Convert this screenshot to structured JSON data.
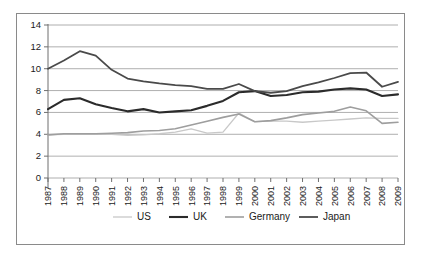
{
  "chart_data": {
    "type": "line",
    "title": "",
    "subtitle": "",
    "xlabel": "",
    "ylabel": "",
    "ylim": [
      0,
      14
    ],
    "yticks": [
      0,
      2,
      4,
      6,
      8,
      10,
      12,
      14
    ],
    "ytick_labels": [
      "0",
      "2",
      "4",
      "6",
      "8",
      "10",
      "12",
      "14"
    ],
    "grid": true,
    "grid_axis": "y",
    "legend_position": "bottom",
    "x": [
      1987,
      1988,
      1989,
      1990,
      1991,
      1992,
      1993,
      1994,
      1995,
      1996,
      1997,
      1998,
      1999,
      2000,
      2001,
      2002,
      2003,
      2004,
      2005,
      2006,
      2007,
      2008,
      2009
    ],
    "categories": [
      "1987",
      "1988",
      "1989",
      "1990",
      "1991",
      "1992",
      "1993",
      "1994",
      "1995",
      "1996",
      "1997",
      "1998",
      "1999",
      "2000",
      "2001",
      "2002",
      "2003",
      "2004",
      "2005",
      "2006",
      "2007",
      "2008",
      "2009"
    ],
    "series": [
      {
        "name": "US",
        "color": "#c8c8c8",
        "width": 1.3,
        "values": [
          3.95,
          4.0,
          4.05,
          4.0,
          4.0,
          3.9,
          3.95,
          4.05,
          4.2,
          4.5,
          4.1,
          4.2,
          5.95,
          5.15,
          5.2,
          5.2,
          5.1,
          5.2,
          5.3,
          5.4,
          5.5,
          5.45,
          5.45
        ]
      },
      {
        "name": "UK",
        "color": "#2b2b2b",
        "width": 2.1,
        "values": [
          6.3,
          7.15,
          7.3,
          6.75,
          6.4,
          6.1,
          6.3,
          6.0,
          6.1,
          6.2,
          6.6,
          7.05,
          7.85,
          7.95,
          7.5,
          7.6,
          7.85,
          7.9,
          8.1,
          8.2,
          8.1,
          7.5,
          7.65
        ]
      },
      {
        "name": "Germany",
        "color": "#9e9e9e",
        "width": 1.6,
        "values": [
          3.95,
          4.05,
          4.05,
          4.05,
          4.1,
          4.15,
          4.3,
          4.35,
          4.5,
          4.85,
          5.2,
          5.55,
          5.85,
          5.15,
          5.25,
          5.5,
          5.8,
          5.95,
          6.1,
          6.5,
          6.15,
          5.0,
          5.1
        ]
      },
      {
        "name": "Japan",
        "color": "#4a4a4a",
        "width": 1.8,
        "values": [
          10.0,
          10.75,
          11.6,
          11.2,
          9.9,
          9.1,
          8.85,
          8.65,
          8.5,
          8.4,
          8.15,
          8.15,
          8.6,
          7.95,
          7.8,
          7.95,
          8.4,
          8.75,
          9.15,
          9.6,
          9.65,
          8.35,
          8.8
        ]
      }
    ]
  },
  "legend": {
    "items": [
      {
        "label": "US"
      },
      {
        "label": "UK"
      },
      {
        "label": "Germany"
      },
      {
        "label": "Japan"
      }
    ]
  }
}
